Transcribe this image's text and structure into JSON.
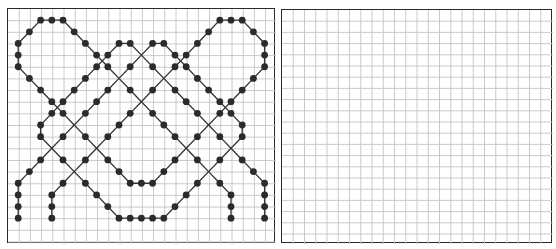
{
  "colors": {
    "grid_line": "#c4c4c4",
    "border": "#2a2a2a",
    "path_line": "#333333",
    "dot": "#2b2b2b",
    "background": "#ffffff"
  },
  "left_panel": {
    "name": "pattern-panel",
    "x": 7,
    "y": 8,
    "width": 268,
    "height": 235,
    "cell_w": 11.2,
    "cell_h": 11.65,
    "cols": 24,
    "rows": 20,
    "dot_radius": 3.4,
    "paths": [
      [
        [
          1,
          18
        ],
        [
          1,
          17
        ],
        [
          1,
          16
        ],
        [
          1,
          15
        ],
        [
          2,
          14
        ],
        [
          3,
          13
        ],
        [
          4,
          12
        ],
        [
          5,
          11
        ],
        [
          6,
          10
        ],
        [
          7,
          9
        ],
        [
          8,
          8
        ],
        [
          9,
          7
        ],
        [
          10,
          6
        ],
        [
          11,
          5
        ],
        [
          12,
          4
        ],
        [
          13,
          3
        ],
        [
          14,
          3
        ],
        [
          15,
          4
        ],
        [
          16,
          5
        ],
        [
          17,
          6
        ],
        [
          18,
          7
        ],
        [
          19,
          8
        ],
        [
          20,
          9
        ],
        [
          21,
          10
        ],
        [
          21,
          11
        ],
        [
          20,
          12
        ],
        [
          19,
          13
        ],
        [
          18,
          14
        ],
        [
          17,
          15
        ],
        [
          16,
          16
        ],
        [
          15,
          17
        ],
        [
          14,
          18
        ],
        [
          13,
          18
        ],
        [
          12,
          18
        ],
        [
          11,
          18
        ],
        [
          10,
          18
        ],
        [
          9,
          17
        ],
        [
          8,
          16
        ],
        [
          7,
          15
        ],
        [
          6,
          14
        ],
        [
          5,
          13
        ],
        [
          4,
          12
        ],
        [
          3,
          11
        ],
        [
          3,
          10
        ],
        [
          4,
          9
        ],
        [
          5,
          8
        ],
        [
          6,
          7
        ],
        [
          7,
          6
        ],
        [
          8,
          5
        ],
        [
          9,
          4
        ],
        [
          10,
          3
        ],
        [
          11,
          3
        ],
        [
          12,
          4
        ],
        [
          13,
          5
        ],
        [
          14,
          6
        ],
        [
          15,
          7
        ],
        [
          16,
          8
        ],
        [
          17,
          9
        ],
        [
          18,
          10
        ],
        [
          19,
          11
        ],
        [
          20,
          12
        ],
        [
          21,
          13
        ],
        [
          22,
          14
        ],
        [
          23,
          15
        ],
        [
          23,
          16
        ],
        [
          23,
          17
        ],
        [
          23,
          18
        ]
      ],
      [
        [
          4,
          18
        ],
        [
          4,
          17
        ],
        [
          4,
          16
        ],
        [
          5,
          15
        ],
        [
          6,
          14
        ],
        [
          7,
          13
        ],
        [
          8,
          12
        ],
        [
          9,
          11
        ],
        [
          10,
          10
        ],
        [
          11,
          9
        ],
        [
          12,
          8
        ],
        [
          13,
          7
        ],
        [
          14,
          6
        ],
        [
          15,
          5
        ],
        [
          16,
          4
        ],
        [
          17,
          3
        ],
        [
          18,
          2
        ],
        [
          19,
          1
        ],
        [
          20,
          1
        ],
        [
          21,
          1
        ],
        [
          22,
          2
        ],
        [
          23,
          3
        ],
        [
          23,
          4
        ],
        [
          23,
          5
        ],
        [
          22,
          6
        ],
        [
          21,
          7
        ],
        [
          20,
          8
        ],
        [
          19,
          9
        ],
        [
          18,
          10
        ],
        [
          17,
          11
        ],
        [
          16,
          12
        ],
        [
          15,
          13
        ],
        [
          14,
          14
        ],
        [
          13,
          15
        ],
        [
          12,
          15
        ],
        [
          11,
          15
        ],
        [
          10,
          14
        ],
        [
          9,
          13
        ],
        [
          8,
          12
        ],
        [
          7,
          11
        ],
        [
          6,
          10
        ],
        [
          5,
          9
        ],
        [
          4,
          8
        ],
        [
          3,
          7
        ],
        [
          2,
          6
        ],
        [
          1,
          5
        ],
        [
          1,
          4
        ],
        [
          1,
          3
        ],
        [
          2,
          2
        ],
        [
          3,
          1
        ],
        [
          4,
          1
        ],
        [
          5,
          1
        ],
        [
          6,
          2
        ],
        [
          7,
          3
        ],
        [
          8,
          4
        ],
        [
          9,
          5
        ],
        [
          10,
          6
        ],
        [
          11,
          7
        ],
        [
          12,
          8
        ],
        [
          13,
          9
        ],
        [
          14,
          10
        ],
        [
          15,
          11
        ],
        [
          16,
          12
        ],
        [
          17,
          13
        ],
        [
          18,
          14
        ],
        [
          19,
          15
        ],
        [
          20,
          16
        ],
        [
          20,
          17
        ],
        [
          20,
          18
        ]
      ]
    ],
    "crossings": [
      [
        4,
        12
      ],
      [
        6,
        10
      ],
      [
        6,
        14
      ],
      [
        8,
        12
      ],
      [
        10,
        6
      ],
      [
        12,
        4
      ],
      [
        12,
        8
      ],
      [
        14,
        6
      ],
      [
        16,
        12
      ],
      [
        18,
        10
      ],
      [
        18,
        14
      ],
      [
        20,
        12
      ]
    ]
  },
  "right_panel": {
    "name": "empty-grid-panel",
    "x": 281,
    "y": 9,
    "width": 271,
    "height": 234,
    "cell_w": 11.25,
    "cell_h": 11.2,
    "cols": 24,
    "rows": 21
  }
}
